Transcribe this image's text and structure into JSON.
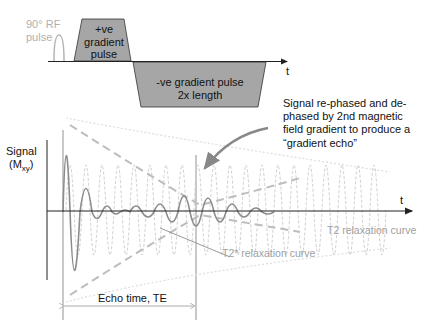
{
  "pulse_sequence": {
    "rf_pulse_label_line1": "90° RF",
    "rf_pulse_label_line2": "pulse",
    "pos_gradient_line1": "+ve",
    "pos_gradient_line2": "gradient",
    "pos_gradient_line3": "pulse",
    "neg_gradient_line1": "-ve gradient pulse",
    "neg_gradient_line2": "2x length",
    "time_axis_label": "t"
  },
  "signal_plot": {
    "y_label_line1": "Signal",
    "y_label_main": "(M",
    "y_label_sub": "xy",
    "y_label_close": ")",
    "time_axis_label": "t",
    "annotation_line1": "Signal re-phased and de-",
    "annotation_line2": "phased by 2nd magnetic",
    "annotation_line3": "field gradient to produce a",
    "annotation_line4": "“gradient echo”",
    "t2_star_label": "T2* relaxation curve",
    "t2_label": "T2 relaxation curve",
    "echo_time_label": "Echo time, TE"
  },
  "colors": {
    "gradient_fill": "#a6a6a6",
    "axis": "#222222",
    "signal": "#8c8c8c",
    "dashed": "#c8c8c8",
    "light_text": "#a0a0a0",
    "text": "#222222"
  }
}
